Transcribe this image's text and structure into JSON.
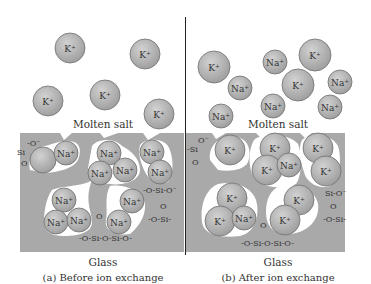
{
  "colors": {
    "glass": "#a9a9a9",
    "ion_fill": "#b3b3b3",
    "ion_stroke": "#6e6e6e",
    "channel": "#ffffff",
    "divider": "#222222",
    "text": "#333333"
  },
  "panels": [
    {
      "id": "a",
      "caption": "(a) Before ion exchange",
      "top_label": "Molten salt",
      "bottom_label": "Glass",
      "salt_ions": [
        {
          "label": "K+",
          "x": 70,
          "y": 48,
          "r": 15
        },
        {
          "label": "K+",
          "x": 145,
          "y": 54,
          "r": 15
        },
        {
          "label": "K+",
          "x": 105,
          "y": 95,
          "r": 15
        },
        {
          "label": "K+",
          "x": 48,
          "y": 101,
          "r": 15
        },
        {
          "label": "K+",
          "x": 159,
          "y": 114,
          "r": 15
        }
      ],
      "glass_ions": [
        {
          "label": "",
          "x": 43,
          "y": 160,
          "r": 13
        },
        {
          "label": "Na+",
          "x": 66,
          "y": 153,
          "r": 12
        },
        {
          "label": "Na+",
          "x": 109,
          "y": 153,
          "r": 12
        },
        {
          "label": "Na+",
          "x": 152,
          "y": 152,
          "r": 12
        },
        {
          "label": "Na+",
          "x": 100,
          "y": 173,
          "r": 12
        },
        {
          "label": "Na+",
          "x": 125,
          "y": 170,
          "r": 12
        },
        {
          "label": "Na+",
          "x": 160,
          "y": 172,
          "r": 12
        },
        {
          "label": "Na+",
          "x": 64,
          "y": 200,
          "r": 12
        },
        {
          "label": "Na+",
          "x": 132,
          "y": 201,
          "r": 12
        },
        {
          "label": "Na+",
          "x": 56,
          "y": 222,
          "r": 12
        },
        {
          "label": "Na+",
          "x": 79,
          "y": 220,
          "r": 12
        },
        {
          "label": "Na+",
          "x": 119,
          "y": 222,
          "r": 12
        }
      ],
      "silicate_labels": [
        {
          "text": "Si",
          "x": 17,
          "y": 155
        },
        {
          "text": "-O⁻",
          "x": 27,
          "y": 146
        },
        {
          "text": "O",
          "x": 21,
          "y": 166
        },
        {
          "text": "-O-Si-O⁻",
          "x": 143,
          "y": 193
        },
        {
          "text": "O",
          "x": 160,
          "y": 209
        },
        {
          "text": "-O-Si-",
          "x": 148,
          "y": 222
        },
        {
          "text": "O",
          "x": 96,
          "y": 219
        },
        {
          "text": "-O-Si-O-Si-O-",
          "x": 79,
          "y": 241
        }
      ]
    },
    {
      "id": "b",
      "caption": "(b) After ion exchange",
      "top_label": "Molten salt",
      "bottom_label": "Glass",
      "salt_ions": [
        {
          "label": "K+",
          "x": 214,
          "y": 67,
          "r": 16
        },
        {
          "label": "Na+",
          "x": 240,
          "y": 88,
          "r": 12
        },
        {
          "label": "Na+",
          "x": 275,
          "y": 62,
          "r": 12
        },
        {
          "label": "K+",
          "x": 315,
          "y": 55,
          "r": 16
        },
        {
          "label": "K+",
          "x": 298,
          "y": 85,
          "r": 16
        },
        {
          "label": "Na+",
          "x": 340,
          "y": 82,
          "r": 12
        },
        {
          "label": "Na+",
          "x": 273,
          "y": 106,
          "r": 12
        },
        {
          "label": "Na+",
          "x": 330,
          "y": 107,
          "r": 12
        },
        {
          "label": "Na+",
          "x": 221,
          "y": 116,
          "r": 12
        }
      ],
      "glass_ions": [
        {
          "label": "K+",
          "x": 230,
          "y": 150,
          "r": 15
        },
        {
          "label": "K+",
          "x": 275,
          "y": 148,
          "r": 15
        },
        {
          "label": "K+",
          "x": 318,
          "y": 148,
          "r": 15
        },
        {
          "label": "K+",
          "x": 267,
          "y": 170,
          "r": 15
        },
        {
          "label": "Na+",
          "x": 289,
          "y": 165,
          "r": 12
        },
        {
          "label": "K+",
          "x": 326,
          "y": 171,
          "r": 15
        },
        {
          "label": "K+",
          "x": 232,
          "y": 198,
          "r": 15
        },
        {
          "label": "K+",
          "x": 220,
          "y": 221,
          "r": 15
        },
        {
          "label": "Na+",
          "x": 244,
          "y": 218,
          "r": 12
        },
        {
          "label": "K+",
          "x": 299,
          "y": 200,
          "r": 15
        },
        {
          "label": "K+",
          "x": 285,
          "y": 220,
          "r": 15
        }
      ],
      "silicate_labels": [
        {
          "text": "-Si",
          "x": 187,
          "y": 152
        },
        {
          "text": "O⁻",
          "x": 198,
          "y": 143
        },
        {
          "text": "O",
          "x": 192,
          "y": 165
        },
        {
          "text": "Si-O⁻",
          "x": 325,
          "y": 196
        },
        {
          "text": "O",
          "x": 330,
          "y": 209
        },
        {
          "text": "-O-Si-",
          "x": 323,
          "y": 222
        },
        {
          "text": "O",
          "x": 260,
          "y": 228
        },
        {
          "text": "-O-Si-O-Si-O-",
          "x": 241,
          "y": 246
        }
      ]
    }
  ]
}
